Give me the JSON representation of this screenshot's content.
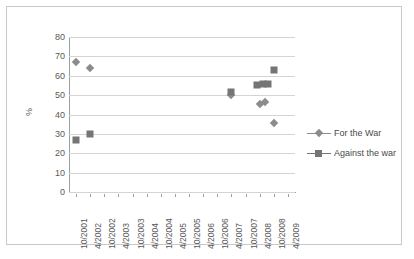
{
  "chart_data": {
    "type": "scatter",
    "title": "",
    "xlabel": "",
    "ylabel": "%",
    "ylim": [
      0,
      80
    ],
    "ytick_step": 10,
    "yticks": [
      80,
      70,
      60,
      50,
      40,
      30,
      20,
      10,
      0
    ],
    "grid": true,
    "legend_position": "right",
    "categories": [
      "10/2001",
      "4/2002",
      "10/2002",
      "4/2003",
      "10/2003",
      "4/2004",
      "10/2004",
      "4/2005",
      "10/2005",
      "4/2006",
      "10/2006",
      "4/2007",
      "10/2007",
      "4/2008",
      "10/2008",
      "4/2009"
    ],
    "series": [
      {
        "name": "For the War",
        "marker": "diamond",
        "color": "#8c8c8c",
        "points": [
          {
            "x": "10/2001",
            "x_index": 0,
            "y": 67
          },
          {
            "x": "4/2002",
            "x_index": 1,
            "y": 64
          },
          {
            "x": "4/2007",
            "x_index": 11,
            "y": 50
          },
          {
            "x": "4/2008",
            "x_index": 13,
            "y": 45.5
          },
          {
            "x": "4/2008",
            "x_index": 13.4,
            "y": 46.5
          },
          {
            "x": "10/2008",
            "x_index": 14,
            "y": 35.5
          }
        ]
      },
      {
        "name": "Against the war",
        "marker": "square",
        "color": "#757575",
        "points": [
          {
            "x": "10/2001",
            "x_index": 0,
            "y": 27
          },
          {
            "x": "4/2002",
            "x_index": 1,
            "y": 30
          },
          {
            "x": "4/2007",
            "x_index": 11,
            "y": 51.5
          },
          {
            "x": "4/2008",
            "x_index": 12.8,
            "y": 55
          },
          {
            "x": "4/2008",
            "x_index": 13.2,
            "y": 55.5
          },
          {
            "x": "4/2008",
            "x_index": 13.6,
            "y": 56
          },
          {
            "x": "10/2008",
            "x_index": 14,
            "y": 63
          }
        ]
      }
    ]
  },
  "legend": {
    "items": [
      {
        "label": "For the War"
      },
      {
        "label": "Against the war"
      }
    ]
  }
}
